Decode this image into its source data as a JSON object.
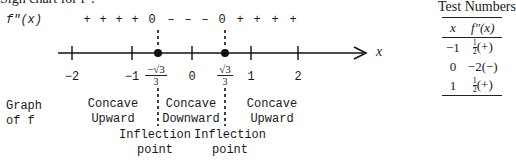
{
  "title": "Sign chart for f″:",
  "sign_chart": {
    "row_label": "f″(x)",
    "signs": [
      {
        "text": "+",
        "x": 87
      },
      {
        "text": "+",
        "x": 103
      },
      {
        "text": "+",
        "x": 119
      },
      {
        "text": "+",
        "x": 135
      },
      {
        "text": "0",
        "x": 152
      },
      {
        "text": "–",
        "x": 171
      },
      {
        "text": "–",
        "x": 188
      },
      {
        "text": "–",
        "x": 205
      },
      {
        "text": "0",
        "x": 222
      },
      {
        "text": "+",
        "x": 240
      },
      {
        "text": "+",
        "x": 257
      },
      {
        "text": "+",
        "x": 275
      },
      {
        "text": "+",
        "x": 293
      }
    ],
    "axis_label": "x",
    "tick_labels": [
      {
        "text": "−2",
        "x": 72
      },
      {
        "text": "−1",
        "x": 132
      },
      {
        "text": "0",
        "x": 192
      },
      {
        "text": "1",
        "x": 251
      },
      {
        "text": "2",
        "x": 298
      }
    ],
    "critical_points": [
      {
        "sign": "−",
        "numerator": "√3",
        "denominator": "3",
        "x": 158
      },
      {
        "sign": "",
        "numerator": "√3",
        "denominator": "3",
        "x": 225
      }
    ]
  },
  "graph_row": {
    "label_line1": "Graph",
    "label_line2": "of f",
    "regions": [
      {
        "line1": "Concave",
        "line2": "Upward",
        "x": 113
      },
      {
        "line1": "Concave",
        "line2": "Downward",
        "x": 191
      },
      {
        "line1": "Concave",
        "line2": "Upward",
        "x": 272
      }
    ],
    "inflection": [
      {
        "line1": "Inflection",
        "line2": "point",
        "x": 155
      },
      {
        "line1": "Inflection",
        "line2": "point",
        "x": 230
      }
    ]
  },
  "test_numbers": {
    "title": "Test Numbers",
    "headers": [
      "x",
      "f″(x)"
    ],
    "rows": [
      {
        "x": "−1",
        "num": "1",
        "den": "2",
        "sign": "(+)"
      },
      {
        "x": "0",
        "value": "−2(−)"
      },
      {
        "x": "1",
        "num": "1",
        "den": "2",
        "sign": "(+)"
      }
    ]
  }
}
